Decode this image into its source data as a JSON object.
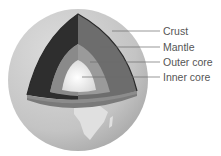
{
  "diagram": {
    "labels": [
      {
        "id": "crust",
        "text": "Crust"
      },
      {
        "id": "mantle",
        "text": "Mantle"
      },
      {
        "id": "outer-core",
        "text": "Outer core"
      },
      {
        "id": "inner-core",
        "text": "Inner core"
      }
    ],
    "colors": {
      "globe": "#c9c9c9",
      "globe_shade": "#a8a8a8",
      "continent": "#e2e2e2",
      "mantle_left": "#2e2e2e",
      "mantle_right": "#6e6e6e",
      "outer_core": "#9a9a9a",
      "inner_core": "#f2f2f2",
      "ledge": "#7c7c7c",
      "leader": "#6a6a6a",
      "text": "#555555"
    }
  }
}
